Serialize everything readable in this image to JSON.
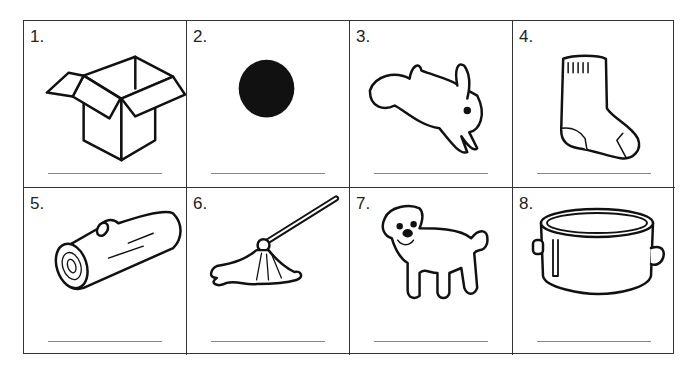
{
  "worksheet": {
    "items": [
      {
        "number": "1.",
        "picture": "box",
        "answer": ""
      },
      {
        "number": "2.",
        "picture": "dot",
        "answer": ""
      },
      {
        "number": "3.",
        "picture": "rabbit",
        "answer": ""
      },
      {
        "number": "4.",
        "picture": "sock",
        "answer": ""
      },
      {
        "number": "5.",
        "picture": "log",
        "answer": ""
      },
      {
        "number": "6.",
        "picture": "mop",
        "answer": ""
      },
      {
        "number": "7.",
        "picture": "dog",
        "answer": ""
      },
      {
        "number": "8.",
        "picture": "pot",
        "answer": ""
      }
    ]
  }
}
